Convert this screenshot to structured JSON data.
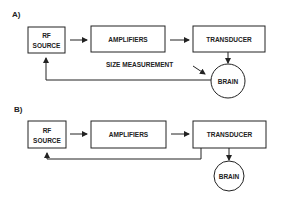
{
  "diagram_a": {
    "label": "A)",
    "rf_source_line1": "RF",
    "rf_source_line2": "SOURCE",
    "amplifiers": "AMPLIFIERS",
    "transducer": "TRANSDUCER",
    "brain": "BRAIN",
    "feedback_label": "SIZE MEASUREMENT"
  },
  "diagram_b": {
    "label": "B)",
    "rf_source_line1": "RF",
    "rf_source_line2": "SOURCE",
    "amplifiers": "AMPLIFIERS",
    "transducer": "TRANSDUCER",
    "brain": "BRAIN"
  },
  "colors": {
    "line": "#222222",
    "background": "#ffffff"
  }
}
